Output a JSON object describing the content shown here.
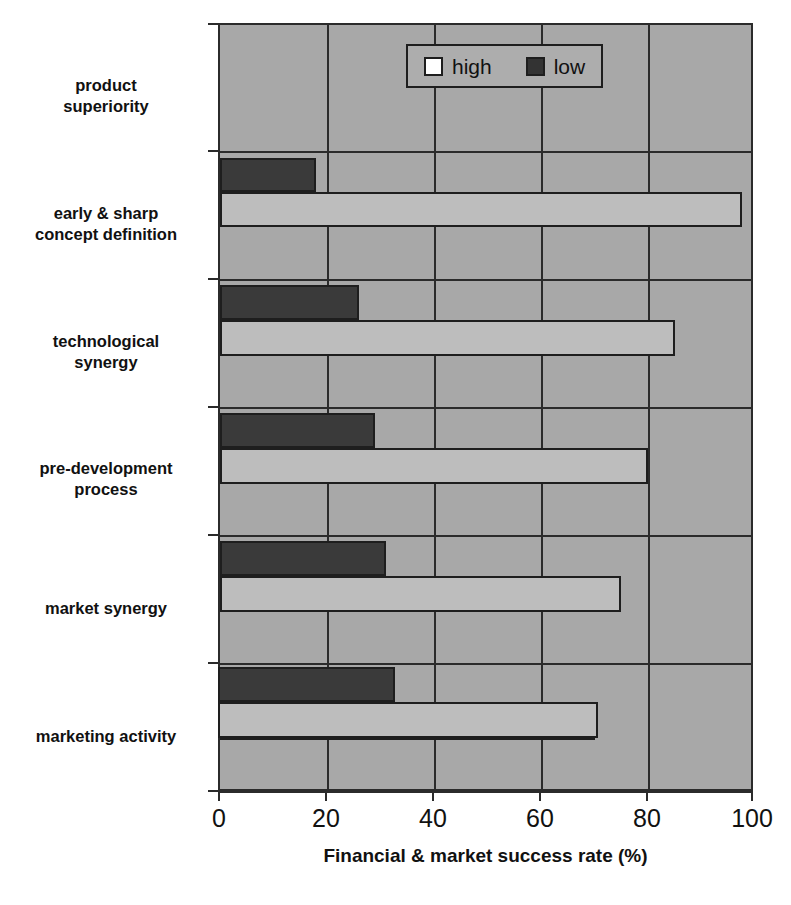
{
  "chart_data": {
    "type": "bar",
    "orientation": "horizontal",
    "title": "",
    "xlabel": "Financial & market success rate (%)",
    "ylabel": "",
    "xlim": [
      0,
      100
    ],
    "xticks": [
      0,
      20,
      40,
      60,
      80,
      100
    ],
    "xtick_labels": [
      "0",
      "20",
      "40",
      "60",
      "80",
      "100"
    ],
    "grid": true,
    "grid_axis": "x",
    "legend_position": "top-center",
    "categories": [
      "product\nsuperiority",
      "early & sharp\nconcept definition",
      "technological\nsynergy",
      "pre-development\nprocess",
      "market synergy",
      "marketing activity"
    ],
    "series": [
      {
        "name": "high",
        "color": "#bdbdbd",
        "values": [
          97.5,
          85,
          80,
          75,
          70,
          71
        ]
      },
      {
        "name": "low",
        "color": "#3a3a3a",
        "values": [
          18,
          26,
          29,
          31,
          31,
          33
        ]
      }
    ],
    "legend": [
      {
        "label": "high",
        "swatch": "high"
      },
      {
        "label": "low",
        "swatch": "low"
      }
    ]
  },
  "colors": {
    "plot_background": "#a8a8a8",
    "legend_background": "#adadad",
    "axis": "#2b2b2b",
    "high_bar": "#bdbdbd",
    "low_bar": "#3a3a3a",
    "text": "#111111"
  }
}
